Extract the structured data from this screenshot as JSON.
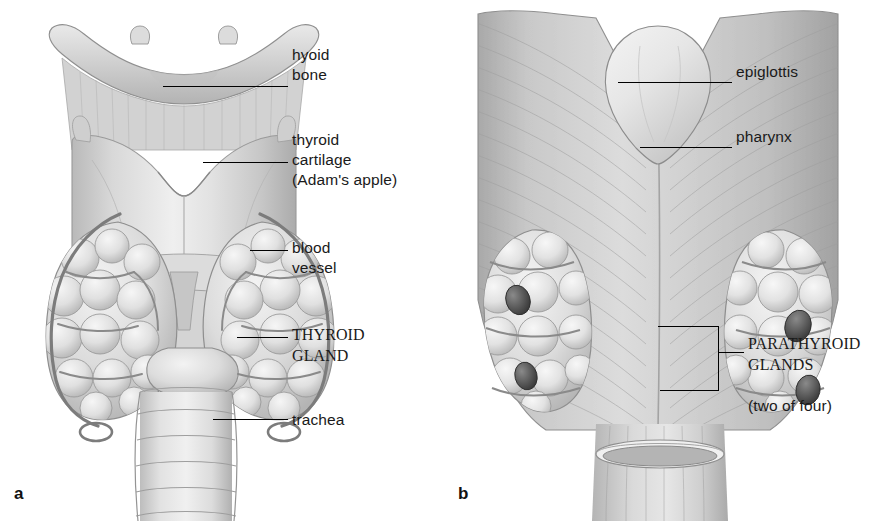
{
  "figure": {
    "background_color": "#ffffff",
    "line_color": "#000000",
    "text_color": "#1a1a1a",
    "width": 885,
    "height": 521
  },
  "panels": [
    {
      "id": "a",
      "letter": "a",
      "view": "anterior",
      "labels": [
        {
          "id": "hyoid-bone",
          "text": "hyoid\nbone",
          "style": "sans",
          "x": 292,
          "y": 45,
          "leader": {
            "x1": 163,
            "x2": 288,
            "y": 86
          }
        },
        {
          "id": "thyroid-cartilage",
          "text": "thyroid\ncartilage\n(Adam's apple)",
          "style": "sans",
          "x": 292,
          "y": 130,
          "leader": {
            "x1": 203,
            "x2": 288,
            "y": 162
          }
        },
        {
          "id": "blood-vessel",
          "text": "blood\nvessel",
          "style": "sans",
          "x": 292,
          "y": 238,
          "leader": {
            "x1": 250,
            "x2": 288,
            "y": 250
          }
        },
        {
          "id": "thyroid-gland",
          "text": "THYROID\nGLAND",
          "style": "serif",
          "x": 292,
          "y": 325,
          "leader": {
            "x1": 237,
            "x2": 288,
            "y": 337
          }
        },
        {
          "id": "trachea",
          "text": "trachea",
          "style": "sans",
          "x": 292,
          "y": 410,
          "leader": {
            "x1": 213,
            "x2": 288,
            "y": 419
          }
        }
      ]
    },
    {
      "id": "b",
      "letter": "b",
      "view": "posterior",
      "labels": [
        {
          "id": "epiglottis",
          "text": "epiglottis",
          "style": "sans",
          "x": 736,
          "y": 72,
          "leader": {
            "x1": 618,
            "x2": 732,
            "y": 82
          }
        },
        {
          "id": "pharynx",
          "text": "pharynx",
          "style": "sans",
          "x": 736,
          "y": 137,
          "leader": {
            "x1": 640,
            "x2": 732,
            "y": 147
          }
        },
        {
          "id": "parathyroid-glands",
          "text": "PARATHYROID\nGLANDS",
          "sub_text": "(two of four)",
          "style": "mixed",
          "x": 748,
          "y": 312,
          "bracket": {
            "x_spine": 718,
            "y_top": 326,
            "y_bottom": 390,
            "stub_x1": 658,
            "stub_upper_y": 326,
            "stub_x2": 660,
            "stub_lower_y": 390,
            "out_x": 744,
            "out_y": 352
          }
        }
      ]
    }
  ]
}
